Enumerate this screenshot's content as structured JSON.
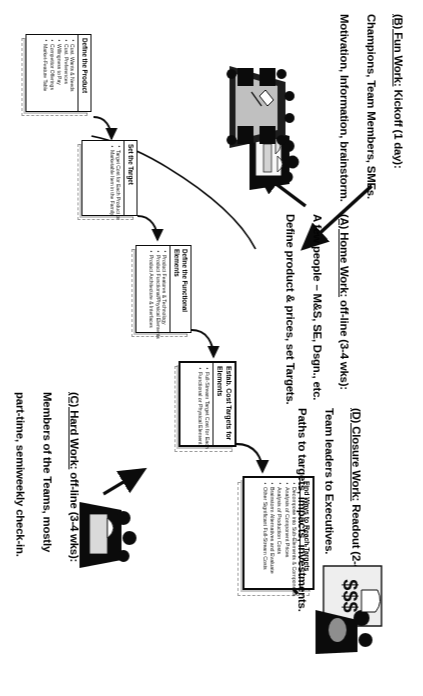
{
  "document": {
    "title": "Target Costing Process Flow",
    "orientation": "rotated-90-clockwise",
    "colors": {
      "ink": "#111111",
      "paper": "#ffffff",
      "ghost": "#9a9a9a"
    }
  },
  "callouts": [
    {
      "id": "a",
      "lead": "(A) Home Work:",
      "rest": " off-line (3-4 wks):",
      "line2": "A few people – M&S, SE, Dsgn., etc.",
      "line3": "Define product & prices, set Targets."
    },
    {
      "id": "b",
      "lead": "(B) Fun Work:",
      "rest": "  Kickoff (1 day):",
      "line2": "Champions, Team Members, SMEs.",
      "line3": "Motivation, Information, brainstorm."
    },
    {
      "id": "c",
      "lead": "(C) Hard Work:",
      "rest": " off-line (3-4 wks):",
      "line2": "Members of the Teams, mostly",
      "line3": "part-time, semiweekly check-in.",
      "line4": "Validate, evaluate, estimate."
    },
    {
      "id": "d",
      "lead": "(D) Closure Work:",
      "rest": " Readout (2-4 hrs):",
      "line2": "Team leaders to Executives.",
      "line3": "Paths to targets, impacts, investments."
    }
  ],
  "boxes": [
    {
      "id": "define-product",
      "title": "Define the Product",
      "bullets": [
        "Cust. Wants & Needs",
        "Cust. Preferences",
        "Willingness to Pay",
        "Competitor Offerings",
        "Market-Feature Table"
      ]
    },
    {
      "id": "set-target",
      "title": "Set the Target",
      "bullets": [
        "Target Cost for Each Product or",
        "Marketable Item in the Family"
      ]
    },
    {
      "id": "define-functional-elements",
      "title": "Define the Functional Elements",
      "bullets": [
        "Product Features & Technology",
        "Product Functional/Physical Elements",
        "Product Architecture & Interfaces"
      ]
    },
    {
      "id": "estab-cost-targets",
      "title": "Estab. Cost Targets for Elements",
      "bullets": [
        "Full-Stream Target Cost for Each",
        "Functional or Physical Element"
      ]
    },
    {
      "id": "find-ways",
      "title": "Find Ways to Reach Targets",
      "bullets": [
        "Decompose into Sub-Elements & Components",
        "Analysis of Component Prices",
        "Analysis of Production Costs",
        "Brainstorm Alternatives and Evaluate",
        "Other Significant Full-Stream Costs"
      ]
    }
  ],
  "artwork": [
    {
      "id": "home-work-art",
      "name": "small-team-meeting-clipart"
    },
    {
      "id": "kickoff-art",
      "name": "large-conference-table-clipart"
    },
    {
      "id": "money-art",
      "name": "executives-with-money-clipart",
      "label": "$$$"
    },
    {
      "id": "hard-work-art",
      "name": "team-working-clipart"
    }
  ]
}
